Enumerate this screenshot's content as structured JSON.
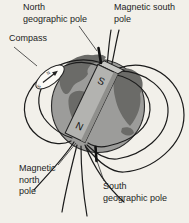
{
  "figure": {
    "labels": {
      "north_geographic": {
        "text": "North\ngeographic pole"
      },
      "magnetic_south": {
        "text": "Magnetic south\npole"
      },
      "compass": {
        "text": "Compass"
      },
      "magnetic_north": {
        "text": "Magnetic\nnorth\npole"
      },
      "south_geographic": {
        "text": "South\ngeographic pole"
      }
    },
    "magnet": {
      "top_pole_letter": "S",
      "bottom_pole_letter": "N"
    },
    "compass": {
      "north_letter": "N",
      "south_letter": "S"
    },
    "colors": {
      "background": "#f2f0ea",
      "ocean": "#9c9c9a",
      "land": "#6b6b68",
      "magnet_body": "#b3b3b0",
      "magnet_side": "#8f8f8c",
      "magnet_top_face": "#c6c6c3",
      "field_line": "#1b1b1b",
      "pointer_line": "#2e2e2e",
      "compass_face": "#fbfaf6"
    }
  }
}
